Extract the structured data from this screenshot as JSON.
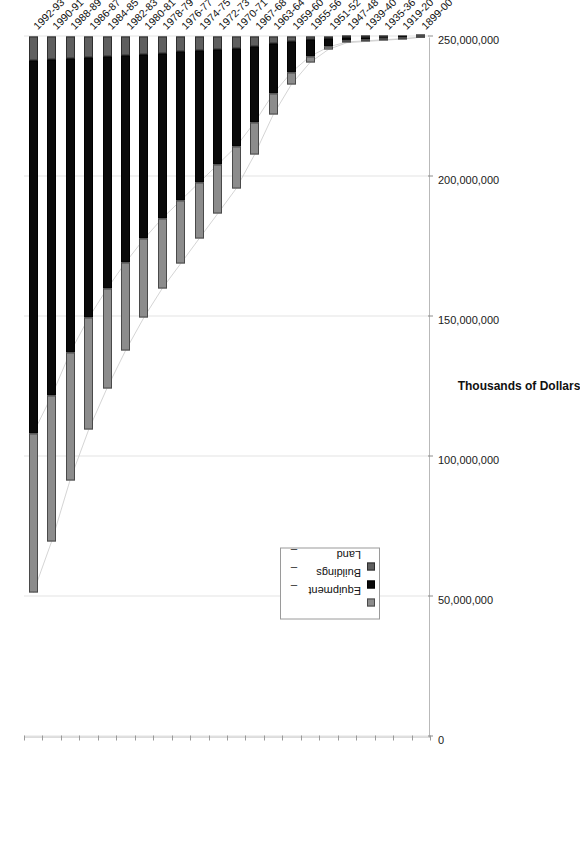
{
  "chart_data": {
    "type": "bar",
    "orientation": "horizontal-stacked",
    "title": "",
    "subtitle": "",
    "xlabel": "",
    "ylabel": "Thousands of Dollars",
    "value_axis_label": "Thousands of Dollars",
    "ylim": [
      0,
      250000000
    ],
    "xlim": [
      0,
      250000000
    ],
    "grid": true,
    "legend_position": "inside-lower-left",
    "tick_labels": [
      "0",
      "50,000,000",
      "100,000,000",
      "150,000,000",
      "200,000,000",
      "250,000,000"
    ],
    "tick_values": [
      0,
      50000000,
      100000000,
      150000000,
      200000000,
      250000000
    ],
    "categories": [
      "1899-00",
      "1919-20",
      "1935-36",
      "1939-40",
      "1947-48",
      "1951-52",
      "1955-56",
      "1959-60",
      "1963-64",
      "1967-68",
      "1970-71",
      "1972-73",
      "1974-75",
      "1976-77",
      "1978-79",
      "1980-81",
      "1982-83",
      "1984-85",
      "1986-87",
      "1988-89",
      "1990-91",
      "1992-93"
    ],
    "series": [
      {
        "name": "Land",
        "color": "#5f5f5f",
        "values": [
          60000,
          180000,
          260000,
          340000,
          420000,
          700000,
          1100000,
          1700000,
          2500000,
          3600000,
          4300000,
          4700000,
          5100000,
          5500000,
          5900000,
          6300000,
          6700000,
          7100000,
          7500000,
          7900000,
          8300000,
          8700000
        ]
      },
      {
        "name": "Buildings",
        "color": "#0a0a0a",
        "values": [
          200000,
          600000,
          900000,
          1200000,
          1500000,
          3000000,
          6000000,
          11000000,
          18000000,
          27000000,
          35000000,
          41000000,
          47000000,
          53000000,
          59000000,
          66000000,
          74000000,
          83000000,
          93000000,
          105000000,
          120000000,
          133000000
        ]
      },
      {
        "name": "Equipment",
        "color": "#8c8c8c",
        "values": [
          40000,
          120000,
          180000,
          240000,
          300000,
          900000,
          2200000,
          4300000,
          7500000,
          11500000,
          15000000,
          17500000,
          20000000,
          22500000,
          25000000,
          28000000,
          31500000,
          35500000,
          40000000,
          45500000,
          52000000,
          57000000
        ]
      }
    ],
    "totals": [
      300000,
      900000,
      1340000,
      1780000,
      2220000,
      4600000,
      9300000,
      17000000,
      28000000,
      42100000,
      54300000,
      63200000,
      72100000,
      81000000,
      89900000,
      100300000,
      112200000,
      125600000,
      140500000,
      158400000,
      180300000,
      198700000
    ]
  },
  "legend": {
    "items": [
      {
        "label": "Equipment",
        "dash": "_",
        "swatch": "equipment"
      },
      {
        "label": "Buildings",
        "dash": "_",
        "swatch": "buildings"
      },
      {
        "label": "Land",
        "dash": "_",
        "swatch": "land"
      }
    ]
  }
}
